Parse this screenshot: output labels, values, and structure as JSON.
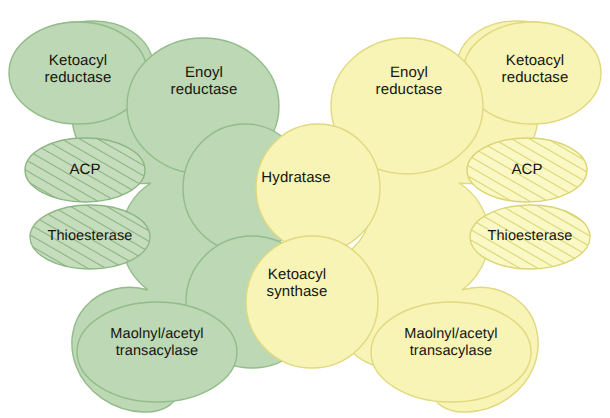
{
  "figure": {
    "subunits": [
      {
        "id": "left",
        "color_name": "green",
        "fill": "#bcd8b4",
        "stroke": "#8fba86",
        "hatch": "#7fae79"
      },
      {
        "id": "right",
        "color_name": "yellow",
        "fill": "#f7f4b6",
        "stroke": "#ddd77d",
        "hatch": "#d9d26f"
      }
    ],
    "background": "#ffffff"
  },
  "domains": {
    "left": {
      "ketoacyl_reductase": "Ketoacyl\nreductase",
      "enoyl_reductase": "Enoyl\nreductase",
      "acp": "ACP",
      "thioesterase": "Thioesterase",
      "hydratase": "Hydratase",
      "ketoacyl_synthase": "Ketoacyl\nsynthase",
      "transacylase": "Maolnyl/acetyl\ntransacylase"
    },
    "right": {
      "enoyl_reductase": "Enoyl\nreductase",
      "ketoacyl_reductase": "Ketoacyl\nreductase",
      "acp": "ACP",
      "thioesterase": "Thioesterase",
      "transacylase": "Maolnyl/acetyl\ntransacylase"
    }
  }
}
